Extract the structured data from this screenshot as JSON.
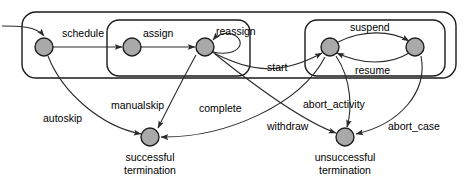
{
  "diagram": {
    "type": "state-transition-diagram",
    "title": "",
    "canvas": {
      "width": 465,
      "height": 181
    },
    "colors": {
      "node_fill": "#a9a9a9",
      "node_stroke": "#1f1f1f",
      "edge_stroke": "#2a2a2a",
      "box_stroke": "#1a1a1a",
      "background": "#ffffff",
      "label_text": "#000000"
    },
    "containers": [
      {
        "id": "outer",
        "name": "outer-group",
        "label": "",
        "x": 22,
        "y": 12,
        "width": 434,
        "height": 66,
        "rx": 14
      },
      {
        "id": "assign-group",
        "name": "assign-group",
        "label": "",
        "x": 107,
        "y": 20,
        "width": 143,
        "height": 56,
        "rx": 12
      },
      {
        "id": "execute-group",
        "name": "execute-group",
        "label": "",
        "x": 305,
        "y": 20,
        "width": 140,
        "height": 56,
        "rx": 12
      }
    ],
    "nodes": [
      {
        "id": "n1",
        "name": "state-node-scheduled",
        "label": "",
        "cx": 44,
        "cy": 47,
        "r": 9
      },
      {
        "id": "n2",
        "name": "state-node-assigned",
        "label": "",
        "cx": 132,
        "cy": 47,
        "r": 9
      },
      {
        "id": "n3",
        "name": "state-node-reassigned",
        "label": "",
        "cx": 205,
        "cy": 47,
        "r": 9
      },
      {
        "id": "n4",
        "name": "state-node-started",
        "label": "",
        "cx": 330,
        "cy": 47,
        "r": 9
      },
      {
        "id": "n5",
        "name": "state-node-suspended",
        "label": "",
        "cx": 415,
        "cy": 47,
        "r": 9
      },
      {
        "id": "n6",
        "name": "state-node-successful-termination",
        "label": "successful\ntermination",
        "label_line1": "successful",
        "label_line2": "termination",
        "cx": 150,
        "cy": 137,
        "r": 9
      },
      {
        "id": "n7",
        "name": "state-node-unsuccessful-termination",
        "label": "unsuccessful\ntermination",
        "label_line1": "unsuccessful",
        "label_line2": "termination",
        "cx": 345,
        "cy": 137,
        "r": 9
      }
    ],
    "transitions": [
      {
        "id": "t0",
        "name": "transition-initial",
        "label": "",
        "from": "",
        "to": "n1"
      },
      {
        "id": "t1",
        "name": "transition-schedule",
        "label": "schedule",
        "from": "n1",
        "to": "n2",
        "label_x": 62,
        "label_y": 34
      },
      {
        "id": "t2",
        "name": "transition-assign",
        "label": "assign",
        "from": "n2",
        "to": "n3",
        "label_x": 143,
        "label_y": 34
      },
      {
        "id": "t3",
        "name": "transition-reassign",
        "label": "reassign",
        "from": "n3",
        "to": "n3",
        "label_x": 216,
        "label_y": 32
      },
      {
        "id": "t4",
        "name": "transition-start",
        "label": "start",
        "from": "n3",
        "to": "n4",
        "label_x": 267,
        "label_y": 68
      },
      {
        "id": "t5",
        "name": "transition-suspend",
        "label": "suspend",
        "from": "n4",
        "to": "n5",
        "label_x": 350,
        "label_y": 28
      },
      {
        "id": "t6",
        "name": "transition-resume",
        "label": "resume",
        "from": "n5",
        "to": "n4",
        "label_x": 355,
        "label_y": 71
      },
      {
        "id": "t7",
        "name": "transition-autoskip",
        "label": "autoskip",
        "from": "n1",
        "to": "n6",
        "label_x": 43,
        "label_y": 119
      },
      {
        "id": "t8",
        "name": "transition-manualskip",
        "label": "manualskip",
        "from": "n3",
        "to": "n6",
        "label_x": 111,
        "label_y": 106
      },
      {
        "id": "t9",
        "name": "transition-complete",
        "label": "complete",
        "from": "n4",
        "to": "n6",
        "label_x": 199,
        "label_y": 109
      },
      {
        "id": "t10",
        "name": "transition-withdraw",
        "label": "withdraw",
        "from": "n3",
        "to": "n7",
        "label_x": 267,
        "label_y": 127
      },
      {
        "id": "t11",
        "name": "transition-abort-activity",
        "label": "abort_activity",
        "from": "n4",
        "to": "n7",
        "label_x": 303,
        "label_y": 105
      },
      {
        "id": "t12",
        "name": "transition-abort-case",
        "label": "abort_case",
        "from": "n5",
        "to": "n7",
        "label_x": 388,
        "label_y": 127
      }
    ]
  }
}
